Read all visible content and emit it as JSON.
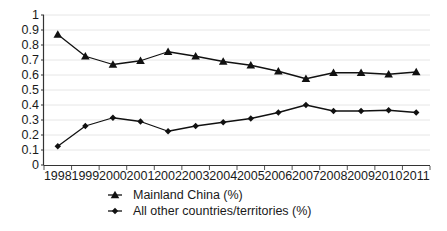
{
  "chart_data": {
    "type": "line",
    "title": "",
    "subtitle": "",
    "xlabel": "",
    "ylabel": "",
    "categories": [
      "1998",
      "1999",
      "2000",
      "2001",
      "2002",
      "2003",
      "2004",
      "2005",
      "2006",
      "2007",
      "2008",
      "2009",
      "2010",
      "2011"
    ],
    "series": [
      {
        "name": "Mainland China (%)",
        "marker": "triangle",
        "color": "#111111",
        "values": [
          0.87,
          0.725,
          0.67,
          0.695,
          0.755,
          0.725,
          0.69,
          0.665,
          0.625,
          0.575,
          0.615,
          0.615,
          0.605,
          0.62
        ]
      },
      {
        "name": "All other countries/territories (%)",
        "marker": "diamond",
        "color": "#111111",
        "values": [
          0.125,
          0.26,
          0.315,
          0.29,
          0.225,
          0.26,
          0.285,
          0.31,
          0.35,
          0.4,
          0.36,
          0.36,
          0.365,
          0.35
        ]
      }
    ],
    "ylim": [
      0,
      1
    ],
    "yticks": [
      "0",
      "0.1",
      "0.2",
      "0.3",
      "0.4",
      "0.5",
      "0.6",
      "0.7",
      "0.8",
      "0.9",
      "1"
    ],
    "ytick_values": [
      0,
      0.1,
      0.2,
      0.3,
      0.4,
      0.5,
      0.6,
      0.7,
      0.8,
      0.9,
      1
    ],
    "xtick_labels": [
      "1998",
      "1999",
      "2000",
      "2001",
      "2002",
      "2003",
      "2004",
      "2005",
      "2006",
      "2007",
      "2008",
      "2009",
      "2010",
      "2011"
    ],
    "grid": true,
    "grid_axis": "y",
    "grid_color": "#e6e6e6",
    "axis_color": "#333333",
    "legend_position": "bottom",
    "legend_entries": [
      "Mainland China (%)",
      "All other countries/territories (%)"
    ],
    "background_color": "#ffffff"
  },
  "legend": {
    "entries": [
      {
        "label": "Mainland China (%)",
        "marker_icon": "triangle-marker-icon"
      },
      {
        "label": "All other countries/territories (%)",
        "marker_icon": "diamond-marker-icon"
      }
    ]
  },
  "axes": {
    "y_axis_name": "y-axis",
    "x_axis_name": "x-axis"
  }
}
